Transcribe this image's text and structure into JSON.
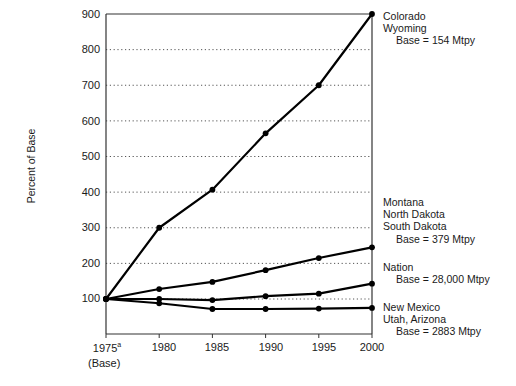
{
  "chart_data": {
    "type": "line",
    "title": "Coal Production Index",
    "xlabel": "",
    "ylabel": "Percent of Base",
    "x": [
      "1975",
      "1980",
      "1985",
      "1990",
      "1995",
      "2000"
    ],
    "xtick_labels": [
      "1975",
      "1980",
      "1985",
      "1990",
      "1995",
      "2000"
    ],
    "x_first_superscript": "a",
    "x_base_note": "(Base)",
    "ylim": [
      0,
      900
    ],
    "yticks": [
      100,
      200,
      300,
      400,
      500,
      600,
      700,
      800,
      900
    ],
    "grid": "horizontal-dotted",
    "legend_position": "right-inline",
    "series": [
      {
        "name": "Colorado / Wyoming",
        "label_lines": [
          "Colorado",
          "Wyoming"
        ],
        "base_label": "Base = 154 Mtpy",
        "base_value": 154,
        "base_units": "Mtpy",
        "values": [
          100,
          300,
          407,
          565,
          700,
          900
        ]
      },
      {
        "name": "Montana / North Dakota / South Dakota",
        "label_lines": [
          "Montana",
          "North Dakota",
          "South Dakota"
        ],
        "base_label": "Base = 379 Mtpy",
        "base_value": 379,
        "base_units": "Mtpy",
        "values": [
          100,
          128,
          148,
          181,
          215,
          245
        ]
      },
      {
        "name": "Nation",
        "label_lines": [
          "Nation"
        ],
        "base_label": "Base = 28,000 Mtpy",
        "base_value": 28000,
        "base_units": "Mtpy",
        "values": [
          100,
          100,
          97,
          108,
          115,
          143
        ]
      },
      {
        "name": "New Mexico / Utah, Arizona",
        "label_lines": [
          "New Mexico",
          "Utah, Arizona"
        ],
        "base_label": "Base = 2883 Mtpy",
        "base_value": 2883,
        "base_units": "Mtpy",
        "values": [
          100,
          88,
          72,
          72,
          73,
          75
        ]
      }
    ]
  },
  "axis": {
    "y_title": "Percent of Base",
    "y_tick_900": "900",
    "y_tick_800": "800",
    "y_tick_700": "700",
    "y_tick_600": "600",
    "y_tick_500": "500",
    "y_tick_400": "400",
    "y_tick_300": "300",
    "y_tick_200": "200",
    "y_tick_100": "100",
    "x_tick_1975": "1975",
    "x_tick_1980": "1980",
    "x_tick_1985": "1985",
    "x_tick_1990": "1990",
    "x_tick_1995": "1995",
    "x_tick_2000": "2000",
    "x_superscript": "a",
    "x_base_note": "(Base)"
  },
  "labels": {
    "colorado": "Colorado",
    "wyoming": "Wyoming",
    "colorado_base": "Base = 154 Mtpy",
    "montana": "Montana",
    "north_dakota": "North Dakota",
    "south_dakota": "South Dakota",
    "montana_base": "Base = 379 Mtpy",
    "nation": "Nation",
    "nation_base": "Base = 28,000 Mtpy",
    "new_mexico": "New Mexico",
    "utah_arizona": "Utah, Arizona",
    "new_mexico_base": "Base = 2883 Mtpy"
  },
  "colors": {
    "line": "#000000",
    "axis": "#333333",
    "grid": "#555555",
    "background": "#ffffff",
    "text": "#1a1a1a"
  },
  "title": {
    "text": "Coal Production Index"
  }
}
